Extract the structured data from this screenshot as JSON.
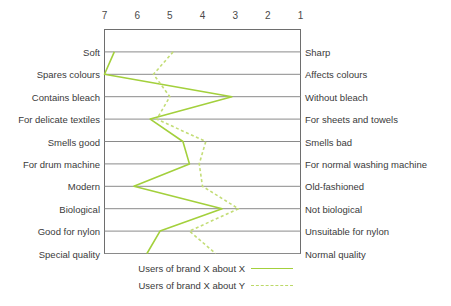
{
  "chart_data": {
    "type": "line",
    "title": "",
    "xlabel": "",
    "ylabel": "",
    "orientation": "horizontal",
    "scale_ticks": [
      "7",
      "6",
      "5",
      "4",
      "3",
      "2",
      "1"
    ],
    "xlim": [
      7,
      1
    ],
    "grid": true,
    "legend_position": "bottom",
    "categories": [
      {
        "left": "Soft",
        "right": "Sharp"
      },
      {
        "left": "Spares colours",
        "right": "Affects colours"
      },
      {
        "left": "Contains bleach",
        "right": "Without bleach"
      },
      {
        "left": "For delicate textiles",
        "right": "For sheets and towels"
      },
      {
        "left": "Smells good",
        "right": "Smells bad"
      },
      {
        "left": "For drum machine",
        "right": "For normal washing machine"
      },
      {
        "left": "Modern",
        "right": "Old-fashioned"
      },
      {
        "left": "Biological",
        "right": "Not biological"
      },
      {
        "left": "Good for nylon",
        "right": "Unsuitable for nylon"
      },
      {
        "left": "Special quality",
        "right": "Normal quality"
      }
    ],
    "series": [
      {
        "name": "Users of brand X about X",
        "style": "solid",
        "color": "#a3d03c",
        "values": [
          6.7,
          7.0,
          3.1,
          5.6,
          4.6,
          4.4,
          6.1,
          3.4,
          5.3,
          5.7
        ]
      },
      {
        "name": "Users of brand X about Y",
        "style": "dashed",
        "color": "#c3dd76",
        "values": [
          4.9,
          5.5,
          5.0,
          5.4,
          3.9,
          4.1,
          4.0,
          2.9,
          4.4,
          3.6
        ]
      }
    ]
  },
  "legend": {
    "items": [
      {
        "label": "Users of brand X about X",
        "style": "solid"
      },
      {
        "label": "Users of brand X about Y",
        "style": "dashed"
      }
    ]
  },
  "colors": {
    "solid_line": "#a3d03c",
    "dashed_line": "#c3dd76",
    "grid": "#8a8a8a",
    "frame": "#6e6e6e",
    "text": "#3a3a3a"
  }
}
